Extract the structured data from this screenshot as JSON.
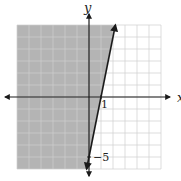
{
  "chart_data": {
    "type": "line",
    "title": "",
    "xlabel": "x",
    "ylabel": "y",
    "xlim": [
      -6,
      6
    ],
    "ylim": [
      -6,
      6
    ],
    "grid": true,
    "grid_step": 1,
    "tick_labels": [
      {
        "axis": "x",
        "value": 1,
        "text": "1"
      },
      {
        "axis": "y",
        "value": -5,
        "text": "−5"
      }
    ],
    "series": [
      {
        "name": "boundary line y = 5x - 5",
        "style": "solid",
        "points": [
          [
            -0.2,
            -6
          ],
          [
            0,
            -5
          ],
          [
            1,
            0
          ],
          [
            2.2,
            6
          ]
        ],
        "arrows": "both"
      }
    ],
    "shaded_region": {
      "description": "region left of / above the line (y > 5x - 5)",
      "color": "#b4b4b4"
    }
  },
  "labels": {
    "x_axis": "x",
    "y_axis": "y",
    "x_tick": "1",
    "y_tick": "−5"
  },
  "colors": {
    "shade": "#b4b4b4",
    "grid_light": "#cfcfcf",
    "grid_dark": "#9a9a9a",
    "axis": "#1a1a1a",
    "line": "#1a1a1a"
  }
}
